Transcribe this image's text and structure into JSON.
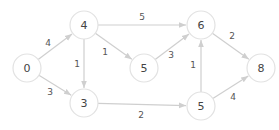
{
  "graph": {
    "directed": true,
    "node_radius": 14,
    "colors": {
      "node_fill": "#ffffff",
      "node_stroke": "#e2e2e2",
      "edge": "#cfcfcf",
      "text": "#444444"
    },
    "nodes": [
      {
        "id": "n0",
        "label": "0",
        "x": 27,
        "y": 68
      },
      {
        "id": "n4",
        "label": "4",
        "x": 84,
        "y": 25
      },
      {
        "id": "n3",
        "label": "3",
        "x": 84,
        "y": 103
      },
      {
        "id": "n5a",
        "label": "5",
        "x": 144,
        "y": 68
      },
      {
        "id": "n6",
        "label": "6",
        "x": 201,
        "y": 25
      },
      {
        "id": "n5b",
        "label": "5",
        "x": 201,
        "y": 106
      },
      {
        "id": "n8",
        "label": "8",
        "x": 261,
        "y": 68
      }
    ],
    "edges": [
      {
        "from": "n0",
        "to": "n4",
        "weight": "4",
        "lx": 48,
        "ly": 43
      },
      {
        "from": "n0",
        "to": "n3",
        "weight": "3",
        "lx": 50,
        "ly": 92
      },
      {
        "from": "n4",
        "to": "n3",
        "weight": "1",
        "lx": 77,
        "ly": 64
      },
      {
        "from": "n4",
        "to": "n5a",
        "weight": "1",
        "lx": 105,
        "ly": 52
      },
      {
        "from": "n4",
        "to": "n6",
        "weight": "5",
        "lx": 142,
        "ly": 17
      },
      {
        "from": "n5a",
        "to": "n6",
        "weight": "3",
        "lx": 171,
        "ly": 55
      },
      {
        "from": "n3",
        "to": "n5b",
        "weight": "2",
        "lx": 141,
        "ly": 115
      },
      {
        "from": "n5b",
        "to": "n6",
        "weight": "1",
        "lx": 193,
        "ly": 65
      },
      {
        "from": "n6",
        "to": "n8",
        "weight": "2",
        "lx": 232,
        "ly": 36
      },
      {
        "from": "n5b",
        "to": "n8",
        "weight": "4",
        "lx": 233,
        "ly": 97
      }
    ]
  }
}
